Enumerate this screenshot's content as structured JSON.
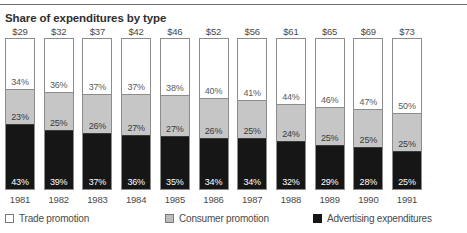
{
  "chart_title": "Share of expenditures by type",
  "legend": {
    "items": [
      {
        "label": "Trade promotion",
        "swatch": "white-square-icon",
        "color": "#ffffff"
      },
      {
        "label": "Consumer promotion",
        "swatch": "gray-square-icon",
        "color": "#c6c6c6"
      },
      {
        "label": "Advertising expenditures",
        "swatch": "black-square-icon",
        "color": "#161616"
      }
    ]
  },
  "chart_data": {
    "type": "bar",
    "title": "Share of expenditures by type",
    "subtype": "stacked-100-percent-column",
    "xlabel": "",
    "ylabel": "",
    "ylim": [
      0,
      100
    ],
    "grid": false,
    "legend_position": "bottom",
    "categories": [
      "1981",
      "1982",
      "1983",
      "1984",
      "1985",
      "1986",
      "1987",
      "1988",
      "1989",
      "1990",
      "1991"
    ],
    "totals": [
      "$29",
      "$32",
      "$37",
      "$42",
      "$46",
      "$52",
      "$56",
      "$61",
      "$65",
      "$69",
      "$73"
    ],
    "series": [
      {
        "name": "Trade promotion",
        "color": "#ffffff",
        "values": [
          34,
          36,
          37,
          37,
          38,
          40,
          41,
          44,
          46,
          47,
          50
        ],
        "labels": [
          "34%",
          "36%",
          "37%",
          "37%",
          "38%",
          "40%",
          "41%",
          "44%",
          "46%",
          "47%",
          "50%"
        ]
      },
      {
        "name": "Consumer promotion",
        "color": "#c6c6c6",
        "values": [
          23,
          25,
          26,
          27,
          27,
          26,
          25,
          24,
          25,
          25,
          25
        ],
        "labels": [
          "23%",
          "25%",
          "26%",
          "27%",
          "27%",
          "26%",
          "25%",
          "24%",
          "25%",
          "25%",
          "25%"
        ]
      },
      {
        "name": "Advertising expenditures",
        "color": "#161616",
        "values": [
          43,
          39,
          37,
          36,
          35,
          34,
          34,
          32,
          29,
          28,
          25
        ],
        "labels": [
          "43%",
          "39%",
          "37%",
          "36%",
          "35%",
          "34%",
          "34%",
          "32%",
          "29%",
          "28%",
          "25%"
        ]
      }
    ]
  }
}
